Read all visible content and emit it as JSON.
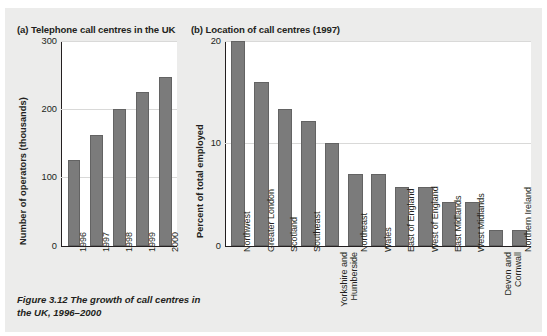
{
  "figure": {
    "caption": "Figure 3.12 The growth of call centres in the UK, 1996–2000",
    "background_color": "#ececeb",
    "bar_color": "#7b7b7b",
    "bar_border_color": "#636363",
    "text_color": "#231f20",
    "gridline_color": "#d9d9d8"
  },
  "panel_a": {
    "title": "(a) Telephone call centres in the UK",
    "ylabel": "Number of operators (thousands)",
    "yticks": [
      "0",
      "100",
      "200",
      "300"
    ],
    "xticks": [
      "1996",
      "1997",
      "1998",
      "1999",
      "2000"
    ]
  },
  "panel_b": {
    "title": "(b) Location of call centres (1997)",
    "ylabel": "Percent of total employed",
    "yticks": [
      "0",
      "10",
      "20"
    ],
    "xticks": [
      "Northwest",
      "Greater London",
      "Scotland",
      "Southeast",
      "Yorkshire and Humberside",
      "Northeast",
      "Wales",
      "East of England",
      "West of England",
      "East Midlands",
      "West Midlands",
      "Devon and Cornwall",
      "Northern Ireland"
    ]
  },
  "chart_data": [
    {
      "type": "bar",
      "id": "panel_a",
      "title": "(a) Telephone call centres in the UK",
      "xlabel": "",
      "ylabel": "Number of operators (thousands)",
      "categories": [
        "1996",
        "1997",
        "1998",
        "1999",
        "2000"
      ],
      "values": [
        126,
        162,
        200,
        225,
        247
      ],
      "ylim": [
        0,
        300
      ],
      "yticks": [
        0,
        100,
        200,
        300
      ],
      "grid": true,
      "legend": false
    },
    {
      "type": "bar",
      "id": "panel_b",
      "title": "(b) Location of call centres (1997)",
      "xlabel": "",
      "ylabel": "Percent of total employed",
      "categories": [
        "Northwest",
        "Greater London",
        "Scotland",
        "Southeast",
        "Yorkshire and Humberside",
        "Northeast",
        "Wales",
        "East of England",
        "West of England",
        "East Midlands",
        "West Midlands",
        "Devon and Cornwall",
        "Northern Ireland"
      ],
      "values": [
        20.0,
        16.0,
        13.4,
        12.2,
        10.0,
        7.0,
        7.0,
        5.7,
        5.7,
        4.3,
        4.3,
        1.5,
        1.5
      ],
      "ylim": [
        0,
        20
      ],
      "yticks": [
        0,
        10,
        20
      ],
      "grid": true,
      "legend": false
    }
  ]
}
